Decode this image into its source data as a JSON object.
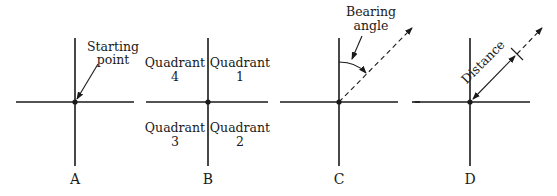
{
  "diagram": {
    "type": "survey bearing / coordinate explanation",
    "colors": {
      "ink": "#1a1a1a",
      "background": "#ffffff"
    },
    "panels": [
      {
        "id": "A",
        "label": "A",
        "annotation_line1": "Starting",
        "annotation_line2": "point"
      },
      {
        "id": "B",
        "label": "B",
        "quadrants": [
          {
            "position": "upper-left",
            "line1": "Quadrant",
            "line2": "4"
          },
          {
            "position": "upper-right",
            "line1": "Quadrant",
            "line2": "1"
          },
          {
            "position": "lower-left",
            "line1": "Quadrant",
            "line2": "3"
          },
          {
            "position": "lower-right",
            "line1": "Quadrant",
            "line2": "2"
          }
        ]
      },
      {
        "id": "C",
        "label": "C",
        "annotation_line1": "Bearing",
        "annotation_line2": "angle"
      },
      {
        "id": "D",
        "label": "D",
        "annotation": "Distance"
      }
    ]
  }
}
